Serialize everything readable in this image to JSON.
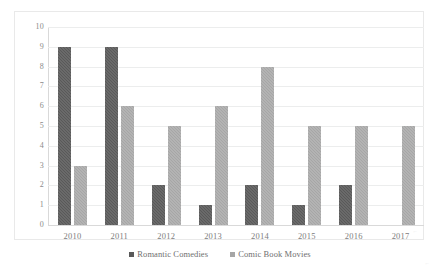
{
  "chart_data": {
    "type": "bar",
    "title": "",
    "subtitle": "",
    "xlabel": "",
    "ylabel": "",
    "categories": [
      "2010",
      "2011",
      "2012",
      "2013",
      "2014",
      "2015",
      "2016",
      "2017"
    ],
    "series": [
      {
        "name": "Romantic Comedies",
        "color": "#595959",
        "values": [
          9,
          9,
          2,
          1,
          2,
          1,
          2,
          0
        ]
      },
      {
        "name": "Comic Book Movies",
        "color": "#a6a6a6",
        "values": [
          3,
          6,
          5,
          6,
          8,
          5,
          5,
          5
        ]
      }
    ],
    "ylim": [
      0,
      10
    ],
    "ytick_step": 1,
    "yticks": [
      "10",
      "9",
      "8",
      "7",
      "6",
      "5",
      "4",
      "3",
      "2",
      "1",
      "0"
    ],
    "grid": true,
    "grid_axis": "y",
    "legend_position": "bottom",
    "plot_border": true,
    "background": "#ffffff",
    "grid_color": "#eceded",
    "axis_color": "#d9d9d9",
    "tick_label_color": "#8a8a8a"
  },
  "marks": {
    "inner": "⌐",
    "outer": "⌐"
  }
}
